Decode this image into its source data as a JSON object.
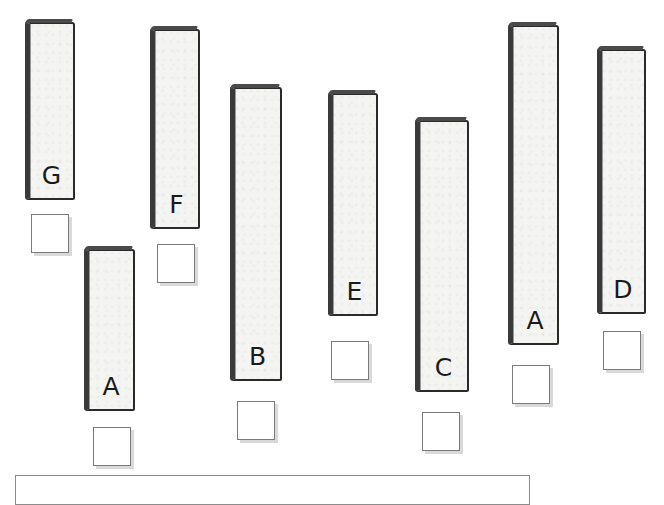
{
  "worksheet": {
    "instruction": "",
    "sticks": [
      {
        "id": "stick-g",
        "label": "G",
        "left": 25,
        "top": 22,
        "width": 50,
        "height": 178
      },
      {
        "id": "stick-a1",
        "label": "A",
        "left": 84,
        "top": 249,
        "width": 51,
        "height": 162
      },
      {
        "id": "stick-f",
        "label": "F",
        "left": 150,
        "top": 29,
        "width": 50,
        "height": 200
      },
      {
        "id": "stick-b",
        "label": "B",
        "left": 230,
        "top": 87,
        "width": 52,
        "height": 294
      },
      {
        "id": "stick-e",
        "label": "E",
        "left": 328,
        "top": 93,
        "width": 50,
        "height": 223
      },
      {
        "id": "stick-c",
        "label": "C",
        "left": 415,
        "top": 120,
        "width": 54,
        "height": 272
      },
      {
        "id": "stick-a2",
        "label": "A",
        "left": 508,
        "top": 25,
        "width": 51,
        "height": 320
      },
      {
        "id": "stick-d",
        "label": "D",
        "left": 597,
        "top": 49,
        "width": 49,
        "height": 265
      }
    ],
    "answer_boxes": [
      {
        "for": "G",
        "left": 31,
        "top": 214,
        "value": ""
      },
      {
        "for": "A",
        "left": 93,
        "top": 427,
        "value": ""
      },
      {
        "for": "F",
        "left": 157,
        "top": 244,
        "value": ""
      },
      {
        "for": "B",
        "left": 237,
        "top": 401,
        "value": ""
      },
      {
        "for": "E",
        "left": 331,
        "top": 341,
        "value": ""
      },
      {
        "for": "C",
        "left": 422,
        "top": 412,
        "value": ""
      },
      {
        "for": "A",
        "left": 512,
        "top": 365,
        "value": ""
      },
      {
        "for": "D",
        "left": 603,
        "top": 331,
        "value": ""
      }
    ],
    "colors": {
      "stick_fill": "#f4f4f3",
      "stick_outline": "#2a2a2a",
      "box_border": "#7a7a7a",
      "box_shadow": "#d9d9d9"
    }
  }
}
